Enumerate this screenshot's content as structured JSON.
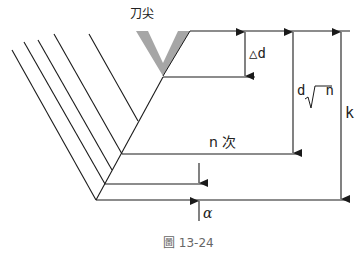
{
  "diagram": {
    "tool_tip_label": "刀尖",
    "delta_d_label": "△d",
    "d_sqrt_n_label": "d√n",
    "d_sqrt_n_parts": {
      "d": "d",
      "sqrt": "√",
      "n": "n"
    },
    "k_label": "k",
    "n_pass_label": "n 次",
    "alpha_label": "α",
    "caption": "圖 13-24",
    "colors": {
      "line": "#1a1a1a",
      "tool": "#a6a6a6",
      "caption": "#666666"
    }
  }
}
